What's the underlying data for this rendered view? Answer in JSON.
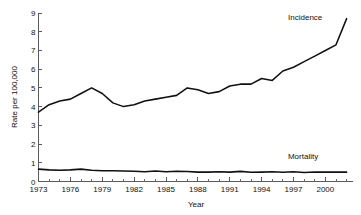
{
  "chart_data": {
    "type": "line",
    "title": "",
    "xlabel": "Year",
    "ylabel": "Rate per 100,000",
    "xlim": [
      1973,
      2002
    ],
    "ylim": [
      0,
      9
    ],
    "grid": false,
    "legend_position": "inline-annotation",
    "x_ticks_labeled": [
      1973,
      1976,
      1979,
      1982,
      1985,
      1988,
      1991,
      1994,
      1997,
      2000
    ],
    "x_ticks_minor_step": 1,
    "y_ticks": [
      0,
      1,
      2,
      3,
      4,
      5,
      6,
      7,
      8,
      9
    ],
    "x": [
      1973,
      1974,
      1975,
      1976,
      1977,
      1978,
      1979,
      1980,
      1981,
      1982,
      1983,
      1984,
      1985,
      1986,
      1987,
      1988,
      1989,
      1990,
      1991,
      1992,
      1993,
      1994,
      1995,
      1996,
      1997,
      1998,
      1999,
      2000,
      2001,
      2002
    ],
    "series": [
      {
        "name": "Incidence",
        "label": "Incidence",
        "color": "#111111",
        "values": [
          3.7,
          4.1,
          4.3,
          4.4,
          4.7,
          5.0,
          4.7,
          4.2,
          4.0,
          4.1,
          4.3,
          4.4,
          4.5,
          4.6,
          5.0,
          4.9,
          4.7,
          4.8,
          5.1,
          5.2,
          5.2,
          5.5,
          5.4,
          5.9,
          6.1,
          6.4,
          6.7,
          7.0,
          7.3,
          8.7
        ]
      },
      {
        "name": "Mortality",
        "label": "Mortality",
        "color": "#111111",
        "values": [
          0.66,
          0.62,
          0.6,
          0.62,
          0.66,
          0.6,
          0.57,
          0.57,
          0.56,
          0.55,
          0.52,
          0.56,
          0.52,
          0.55,
          0.53,
          0.5,
          0.5,
          0.52,
          0.5,
          0.54,
          0.49,
          0.5,
          0.52,
          0.49,
          0.52,
          0.48,
          0.51,
          0.5,
          0.5,
          0.5
        ]
      }
    ],
    "annotations": [
      {
        "text": "Incidence",
        "x": 1998.1,
        "y": 8.65
      },
      {
        "text": "Mortality",
        "x": 1997.9,
        "y": 1.18
      }
    ]
  },
  "axis": {
    "y_label": "Rate per 100,000",
    "x_label": "Year",
    "y_tick_labels": [
      "0",
      "1",
      "2",
      "3",
      "4",
      "5",
      "6",
      "7",
      "8",
      "9"
    ],
    "x_tick_labels": [
      "1973",
      "1976",
      "1979",
      "1982",
      "1985",
      "1988",
      "1991",
      "1994",
      "1997",
      "2000"
    ]
  },
  "series_labels": {
    "incidence": "Incidence",
    "mortality": "Mortality"
  }
}
